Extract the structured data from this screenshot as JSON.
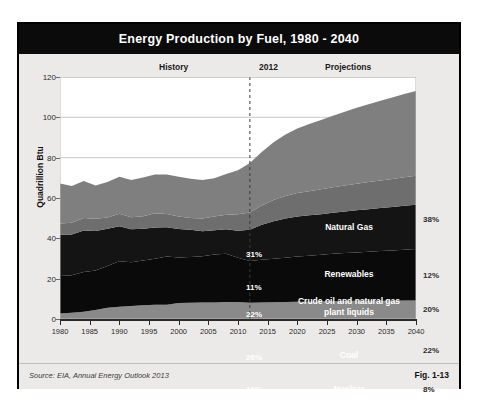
{
  "figure": {
    "title": "Energy Production by Fuel, 1980 - 2040",
    "source": "Source: EIA, Annual Energy Outlook 2013",
    "fig_number": "Fig. 1-13"
  },
  "annotations": {
    "history": "History",
    "divider_year": "2012",
    "projections": "Projections"
  },
  "chart_data": {
    "type": "area",
    "title": "Energy Production by Fuel, 1980 - 2040",
    "xlabel": "",
    "ylabel": "Quadrillion Btu",
    "ylim": [
      0,
      120
    ],
    "xlim": [
      1980,
      2040
    ],
    "yticks": [
      0,
      20,
      40,
      60,
      80,
      100,
      120
    ],
    "xticks": [
      1980,
      1985,
      1990,
      1995,
      2000,
      2005,
      2010,
      2015,
      2020,
      2025,
      2030,
      2035,
      2040
    ],
    "grid": true,
    "stacked": true,
    "divider_x": 2012,
    "legend": "in-plot labels",
    "x": [
      1980,
      1982,
      1984,
      1986,
      1988,
      1990,
      1992,
      1994,
      1996,
      1998,
      2000,
      2002,
      2004,
      2006,
      2008,
      2010,
      2012,
      2014,
      2016,
      2018,
      2020,
      2022,
      2024,
      2026,
      2028,
      2030,
      2032,
      2034,
      2036,
      2038,
      2040
    ],
    "series": [
      {
        "name": "Nuclear",
        "color": "#8a8a8a",
        "share_2012": "10%",
        "share_2040": "8%",
        "values": [
          2.7,
          3.1,
          3.6,
          4.5,
          5.6,
          6.1,
          6.5,
          6.8,
          7.1,
          7.1,
          7.9,
          8.1,
          8.2,
          8.2,
          8.4,
          8.4,
          8.1,
          8.2,
          8.3,
          8.4,
          8.5,
          8.6,
          8.7,
          8.8,
          8.9,
          9.0,
          9.0,
          9.1,
          9.1,
          9.2,
          9.2
        ]
      },
      {
        "name": "Coal",
        "color": "#0a0a0a",
        "share_2012": "26%",
        "share_2040": "22%",
        "values": [
          18.6,
          18.6,
          19.7,
          19.5,
          20.7,
          22.5,
          21.6,
          22.2,
          22.8,
          23.9,
          22.6,
          22.7,
          22.9,
          23.8,
          23.9,
          22.0,
          20.7,
          21.2,
          21.6,
          22.0,
          22.5,
          22.8,
          23.1,
          23.5,
          23.8,
          24.0,
          24.3,
          24.6,
          24.9,
          25.2,
          25.5
        ]
      },
      {
        "name": "Crude oil and natural gas plant liquids",
        "color": "#141414",
        "share_2012": "22%",
        "share_2040": "20%",
        "values": [
          20.5,
          20.2,
          20.6,
          19.6,
          18.4,
          17.4,
          16.4,
          15.8,
          15.5,
          14.5,
          14.1,
          13.4,
          12.4,
          12.0,
          12.2,
          13.4,
          15.4,
          17.3,
          18.6,
          19.4,
          19.8,
          20.0,
          20.2,
          20.4,
          20.6,
          20.9,
          21.1,
          21.3,
          21.5,
          21.8,
          22.0
        ]
      },
      {
        "name": "Renewables",
        "color": "#6e6e6e",
        "share_2012": "11%",
        "share_2040": "12%",
        "values": [
          5.5,
          5.8,
          6.2,
          6.1,
          5.6,
          6.2,
          6.0,
          6.1,
          7.0,
          6.6,
          6.2,
          5.9,
          6.3,
          6.8,
          7.2,
          8.1,
          8.6,
          9.6,
          10.5,
          11.2,
          11.7,
          12.0,
          12.3,
          12.6,
          12.9,
          13.2,
          13.5,
          13.7,
          13.9,
          14.1,
          14.3
        ]
      },
      {
        "name": "Natural Gas",
        "color": "#7f7f7f",
        "share_2012": "31%",
        "share_2040": "38%",
        "values": [
          19.9,
          18.3,
          18.3,
          16.5,
          17.6,
          18.3,
          18.4,
          19.3,
          19.3,
          19.6,
          19.7,
          19.4,
          19.1,
          19.0,
          20.2,
          21.8,
          24.5,
          26.5,
          28.6,
          30.5,
          32.0,
          33.3,
          34.4,
          35.5,
          36.6,
          37.6,
          38.6,
          39.5,
          40.4,
          41.3,
          42.1
        ]
      }
    ],
    "totals_note": "Stacked total rises from ~67 in 1980 to ~113 in 2040"
  }
}
